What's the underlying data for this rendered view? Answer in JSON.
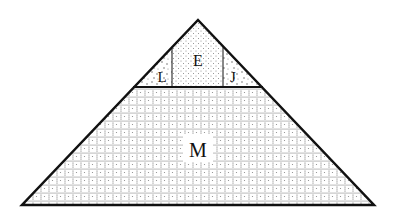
{
  "diagram": {
    "shape": "triangle",
    "regions": [
      {
        "id": "E",
        "label": "E",
        "pattern": "fine-dots"
      },
      {
        "id": "L",
        "label": "L",
        "pattern": "scattered-dots"
      },
      {
        "id": "J",
        "label": "J",
        "pattern": "scattered-dots"
      },
      {
        "id": "M",
        "label": "M",
        "pattern": "dotted-grid"
      }
    ],
    "colors": {
      "stroke": "#111111",
      "fill": "#ffffff",
      "dots": "#555555"
    }
  }
}
